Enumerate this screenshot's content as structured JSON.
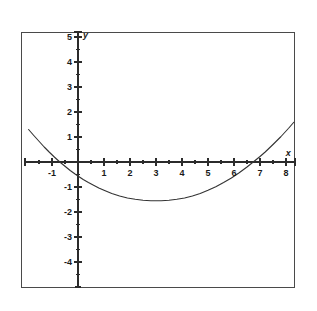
{
  "figure": {
    "background_color": "#ffffff",
    "frame_color": "#4a4a4a",
    "curve_color": "#333333",
    "axis_color": "#2b2b2b",
    "x_axis_name": "x",
    "y_axis_name": "y"
  },
  "chart_data": {
    "type": "line",
    "title": "",
    "subtitle": "",
    "xlabel": "x",
    "ylabel": "y",
    "xlim": [
      -2.0,
      8.3
    ],
    "ylim": [
      -5.0,
      5.2
    ],
    "xticks": [
      -1,
      1,
      2,
      3,
      4,
      5,
      6,
      7,
      8
    ],
    "xtick_labels": [
      "-1",
      "1",
      "2",
      "3",
      "4",
      "5",
      "6",
      "7",
      "8"
    ],
    "yticks": [
      5,
      4,
      3,
      2,
      1,
      -1,
      -2,
      -3,
      -4
    ],
    "ytick_labels": [
      "5",
      "4",
      "3",
      "2",
      "1",
      "-1",
      "-2",
      "-3",
      "-4"
    ],
    "x_minor_tick_step": 0.5,
    "y_minor_tick_step": 0.5,
    "grid": false,
    "legend": false,
    "legend_position": "none",
    "annotations": [],
    "series": [
      {
        "name": "parabola",
        "equation": "y = (x^2 - 6x - 7) / 8",
        "roots": [
          -1,
          7
        ],
        "vertex": [
          3,
          -2
        ],
        "y_intercept": -1,
        "x": [
          -1.9,
          -1.7,
          -1.5,
          -1.3,
          -1.1,
          -1.0,
          -0.9,
          -0.7,
          -0.5,
          -0.3,
          -0.1,
          0.0,
          0.2,
          0.4,
          0.6,
          0.8,
          1.0,
          1.3,
          1.6,
          1.9,
          2.2,
          2.5,
          2.8,
          3.0,
          3.2,
          3.5,
          3.8,
          4.1,
          4.4,
          4.7,
          5.0,
          5.3,
          5.6,
          5.9,
          6.2,
          6.5,
          6.8,
          7.0,
          7.2,
          7.5,
          7.8,
          8.1,
          8.3
        ],
        "y": [
          1.3,
          1.06,
          0.83,
          0.6,
          0.39,
          0.29,
          0.19,
          0.0,
          -0.17,
          -0.34,
          -0.49,
          -0.56,
          -0.7,
          -0.82,
          -0.93,
          -1.04,
          -1.13,
          -1.26,
          -1.36,
          -1.44,
          -1.49,
          -1.53,
          -1.55,
          -1.55,
          -1.55,
          -1.53,
          -1.49,
          -1.44,
          -1.36,
          -1.26,
          -1.13,
          -0.99,
          -0.82,
          -0.64,
          -0.43,
          -0.2,
          0.05,
          0.22,
          0.4,
          0.7,
          1.01,
          1.35,
          1.59
        ]
      }
    ]
  }
}
